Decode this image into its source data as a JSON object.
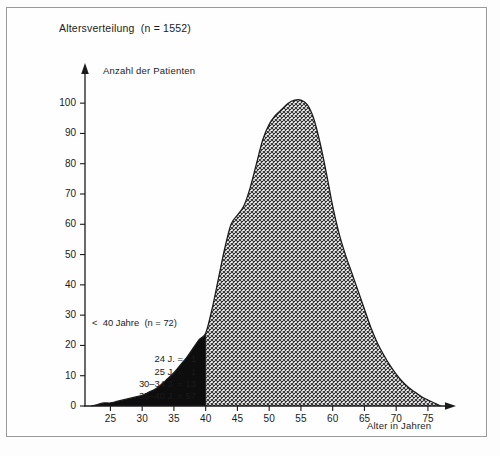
{
  "chart_data": {
    "type": "area",
    "title": "Altersverteilung  (n = 1552)",
    "xlabel": "Alter in Jahren",
    "ylabel": "Anzahl der Patienten",
    "xlim": [
      21,
      78
    ],
    "ylim": [
      0,
      105
    ],
    "grid": false,
    "legend": "none",
    "xticks": [
      25,
      30,
      35,
      40,
      45,
      50,
      55,
      60,
      65,
      70,
      75
    ],
    "yticks": [
      0,
      10,
      20,
      30,
      40,
      50,
      60,
      70,
      80,
      90,
      100
    ],
    "series": [
      {
        "name": "Anzahl der Patienten",
        "x": [
          22,
          23,
          24,
          25,
          26,
          27,
          28,
          29,
          30,
          31,
          32,
          33,
          34,
          35,
          36,
          37,
          38,
          39,
          40,
          41,
          42,
          43,
          44,
          45,
          46,
          47,
          48,
          49,
          50,
          51,
          52,
          53,
          54,
          55,
          56,
          57,
          58,
          59,
          60,
          61,
          62,
          63,
          64,
          65,
          66,
          67,
          68,
          69,
          70,
          71,
          72,
          73,
          74,
          75,
          76,
          77
        ],
        "values": [
          0,
          0.5,
          1,
          1,
          1.5,
          2,
          2.5,
          3,
          3.5,
          4.5,
          5.5,
          7,
          9,
          11,
          13.5,
          16,
          19,
          22,
          24,
          32,
          42,
          52,
          60,
          63,
          66,
          72,
          80,
          88,
          93,
          96,
          98,
          100,
          101,
          101,
          99.5,
          95,
          87,
          77,
          66,
          57,
          50,
          44,
          38,
          32,
          26,
          21,
          17,
          13.5,
          10.5,
          8,
          6,
          4.5,
          3,
          2,
          1,
          0
        ]
      }
    ],
    "regions": [
      {
        "name": "unter-40-schwarz",
        "fill": "solid-black",
        "x_from": 22,
        "x_to": 40
      },
      {
        "name": "ab-40-schraffur",
        "fill": "cross-hatch",
        "x_from": 40,
        "x_to": 77
      }
    ],
    "annotation": {
      "heading": "<  40 Jahre  (n = 72)",
      "lines": [
        "24 J. =   1",
        "25 J. =   1",
        "30–34 J. = 13",
        "35–40 J. = 57"
      ]
    },
    "colors": {
      "axis": "#1b1b1b",
      "curve": "#1b1b1b",
      "solid_fill": "#0d0d0d",
      "hatch": "#3a3a3a",
      "frame": "#9a9a9a",
      "background": "#fefefe"
    }
  }
}
